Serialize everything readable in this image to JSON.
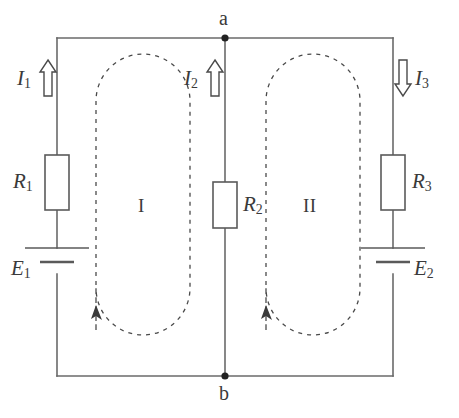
{
  "figure": {
    "kind": "circuit-diagram",
    "width": 459,
    "height": 418,
    "colors": {
      "wire": "#6a6a6a",
      "component_outline": "#5a5a5a",
      "loop_dashed": "#4a4a4a",
      "label_text": "#3a3a3a",
      "node_dot": "#222222",
      "background": "#ffffff"
    }
  },
  "nodes": [
    {
      "id": "a",
      "label": "a",
      "position": "top-center"
    },
    {
      "id": "b",
      "label": "b",
      "position": "bottom-center"
    }
  ],
  "currents": [
    {
      "id": "I1",
      "label": "I",
      "subscript": "1",
      "direction": "up",
      "branch": "left",
      "arrow_style": "hollow",
      "label_side": "left"
    },
    {
      "id": "I2",
      "label": "I",
      "subscript": "2",
      "direction": "up",
      "branch": "middle",
      "arrow_style": "hollow",
      "label_side": "left"
    },
    {
      "id": "I3",
      "label": "I",
      "subscript": "3",
      "direction": "down",
      "branch": "right",
      "arrow_style": "hollow",
      "label_side": "right"
    }
  ],
  "resistors": [
    {
      "id": "R1",
      "label": "R",
      "subscript": "1",
      "branch": "left",
      "label_side": "left"
    },
    {
      "id": "R2",
      "label": "R",
      "subscript": "2",
      "branch": "middle",
      "label_side": "right"
    },
    {
      "id": "R3",
      "label": "R",
      "subscript": "3",
      "branch": "right",
      "label_side": "right"
    }
  ],
  "sources": [
    {
      "id": "E1",
      "label": "E",
      "subscript": "1",
      "branch": "left",
      "type": "battery",
      "long_plate": "top",
      "label_side": "left"
    },
    {
      "id": "E2",
      "label": "E",
      "subscript": "2",
      "branch": "right",
      "type": "battery",
      "long_plate": "top",
      "label_side": "right"
    }
  ],
  "loops": [
    {
      "id": "loop1",
      "label": "I",
      "position": "left-mesh",
      "direction": "counterclockwise",
      "style": "dashed"
    },
    {
      "id": "loop2",
      "label": "II",
      "position": "right-mesh",
      "direction": "counterclockwise",
      "style": "dashed"
    }
  ]
}
